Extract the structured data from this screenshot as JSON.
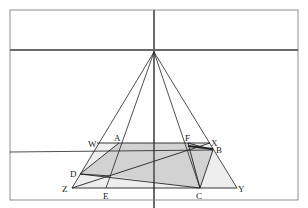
{
  "diagram": {
    "type": "perspective-geometry",
    "colors": {
      "frame": "#8a8a8a",
      "axis": "#6e6e6e",
      "lines": "#222222",
      "shade_dark": "#cfcfcf",
      "shade_light": "#ececec"
    },
    "frame": {
      "x1": 10,
      "y1": 10,
      "x2": 298,
      "y2": 200
    },
    "horizon_y": 50,
    "center_x": 154,
    "apex": {
      "x": 154,
      "y": 52
    },
    "points": {
      "W": {
        "x": 97,
        "y": 143
      },
      "X": {
        "x": 210,
        "y": 143
      },
      "Z": {
        "x": 72,
        "y": 188
      },
      "Y": {
        "x": 237,
        "y": 188
      },
      "A": {
        "x": 119,
        "y": 143
      },
      "F": {
        "x": 188,
        "y": 143
      },
      "D": {
        "x": 80,
        "y": 174
      },
      "E": {
        "x": 106,
        "y": 188
      },
      "C": {
        "x": 200,
        "y": 188
      },
      "B": {
        "x": 213,
        "y": 150
      },
      "P": {
        "x": 111,
        "y": 176
      }
    },
    "labels": [
      {
        "text": "W",
        "x": 88,
        "y": 147
      },
      {
        "text": "A",
        "x": 114,
        "y": 141
      },
      {
        "text": "F",
        "x": 185,
        "y": 141
      },
      {
        "text": "X",
        "x": 211,
        "y": 146
      },
      {
        "text": "B",
        "x": 216,
        "y": 153
      },
      {
        "text": "D",
        "x": 70,
        "y": 177
      },
      {
        "text": "Z",
        "x": 62,
        "y": 192
      },
      {
        "text": "E",
        "x": 103,
        "y": 199
      },
      {
        "text": "C",
        "x": 196,
        "y": 199
      },
      {
        "text": "Y",
        "x": 238,
        "y": 192
      }
    ]
  }
}
